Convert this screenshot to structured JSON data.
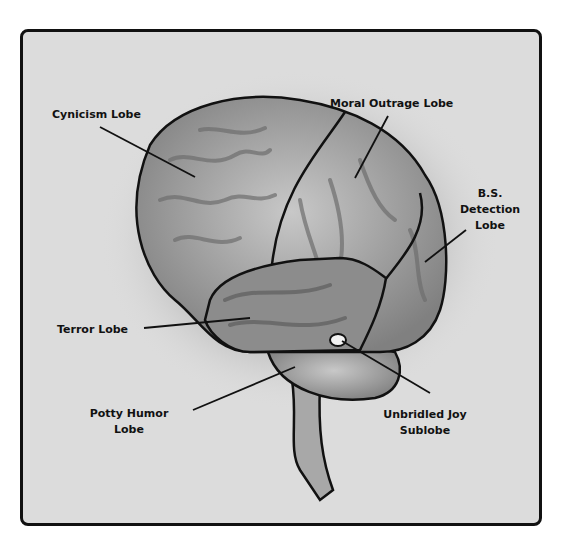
{
  "diagram": {
    "labels": {
      "cynicism": "Cynicism Lobe",
      "moral_outrage": "Moral Outrage Lobe",
      "bs_detection_1": "B.S.",
      "bs_detection_2": "Detection",
      "bs_detection_3": "Lobe",
      "terror": "Terror Lobe",
      "potty_1": "Potty Humor",
      "potty_2": "Lobe",
      "joy_1": "Unbridled Joy",
      "joy_2": "Sublobe"
    },
    "colors": {
      "frame_bg": "#dcdcdc",
      "frame_border": "#111111",
      "brain_fill": "#9a9a9a",
      "brain_highlight": "#d8d8d8",
      "outline": "#111111"
    }
  }
}
